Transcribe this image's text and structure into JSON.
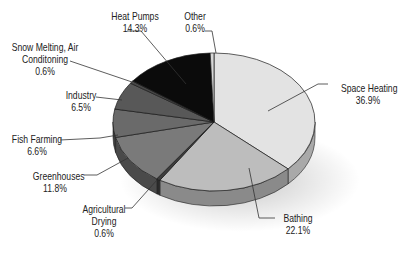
{
  "chart_data": {
    "type": "pie",
    "style": "3d-exploded-none",
    "title": "",
    "start_angle": "12 o'clock",
    "direction": "clockwise",
    "slices": [
      {
        "label": "Space Heating",
        "value": 36.9,
        "display": "36.9%",
        "color": "#e3e3e3",
        "side": "#a9a9a9"
      },
      {
        "label": "Bathing",
        "value": 22.1,
        "display": "22.1%",
        "color": "#bdbdbd",
        "side": "#8a8a8a"
      },
      {
        "label": "Agricultural Drying",
        "value": 0.6,
        "display": "0.6%",
        "color": "#3c3c3c",
        "side": "#2a2a2a"
      },
      {
        "label": "Greenhouses",
        "value": 11.8,
        "display": "11.8%",
        "color": "#7a7a7a",
        "side": "#4a4a4a"
      },
      {
        "label": "Fish Farming",
        "value": 6.6,
        "display": "6.6%",
        "color": "#6a6a6a",
        "side": "#3e3e3e"
      },
      {
        "label": "Industry",
        "value": 6.5,
        "display": "6.5%",
        "color": "#585858",
        "side": "#363636"
      },
      {
        "label": "Snow Melting, Air Conditoning",
        "value": 0.6,
        "display": "0.6%",
        "color": "#474747",
        "side": "#2e2e2e"
      },
      {
        "label": "Heat Pumps",
        "value": 14.3,
        "display": "14.3%",
        "color": "#0b0b0b",
        "side": "#000000"
      },
      {
        "label": "Other",
        "value": 0.6,
        "display": "0.6%",
        "color": "#d8d8d8",
        "side": "#a0a0a0"
      }
    ],
    "legend": "none (callout labels)"
  },
  "labels": {
    "heat_pumps": {
      "name": "Heat Pumps",
      "pct": "14.3%"
    },
    "other": {
      "name": "Other",
      "pct": "0.6%"
    },
    "snow": {
      "name1": "Snow Melting, Air",
      "name2": "Conditoning",
      "pct": "0.6%"
    },
    "industry": {
      "name": "Industry",
      "pct": "6.5%"
    },
    "fish": {
      "name": "Fish Farming",
      "pct": "6.6%"
    },
    "greenhouses": {
      "name": "Greenhouses",
      "pct": "11.8%"
    },
    "agri": {
      "name1": "Agricultural",
      "name2": "Drying",
      "pct": "0.6%"
    },
    "bathing": {
      "name": "Bathing",
      "pct": "22.1%"
    },
    "space": {
      "name": "Space Heating",
      "pct": "36.9%"
    }
  }
}
